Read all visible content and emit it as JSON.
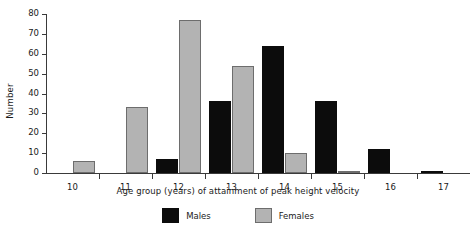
{
  "chart_data": {
    "type": "bar",
    "title": "",
    "xlabel": "Age group (years) of attainment of peak height velocity",
    "ylabel": "Number",
    "categories": [
      "10",
      "11",
      "12",
      "13",
      "14",
      "15",
      "16",
      "17"
    ],
    "series": [
      {
        "name": "Males",
        "color": "#0c0c0c",
        "values": [
          0,
          0,
          7,
          36,
          64,
          36,
          12,
          1
        ]
      },
      {
        "name": "Females",
        "color": "#b3b3b3",
        "values": [
          6,
          33,
          77,
          54,
          10,
          1,
          0,
          0
        ]
      }
    ],
    "ylim": [
      0,
      80
    ],
    "yticks": [
      0,
      10,
      20,
      30,
      40,
      50,
      60,
      70,
      80
    ],
    "grid": false,
    "legend_position": "bottom"
  },
  "legend": {
    "items": [
      {
        "label": "Males"
      },
      {
        "label": "Females"
      }
    ]
  }
}
